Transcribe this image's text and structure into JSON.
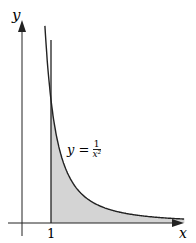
{
  "axes": {
    "x_label": "x",
    "y_label": "y",
    "tick_label": "1"
  },
  "curve": {
    "equation_lhs": "y =",
    "numerator": "1",
    "denominator": "x²"
  },
  "colors": {
    "stroke": "#222222",
    "fill": "#d4d4d4"
  }
}
